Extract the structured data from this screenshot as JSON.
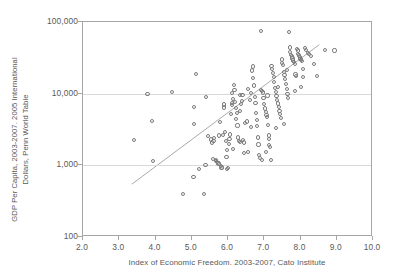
{
  "chart_data": {
    "type": "scatter",
    "title": "",
    "xlabel": "Index of Economic Freedom. 2003-2007, Cato Institute",
    "ylabel_line1": "GDP Per Capita, 2003-2007. 2005 International",
    "ylabel_line2": "Dollars, Penn World Table",
    "xlim": [
      2.0,
      10.0
    ],
    "ylim": [
      100,
      100000
    ],
    "yscale": "log",
    "xscale": "linear",
    "xticks": [
      "2.0",
      "3.0",
      "4.0",
      "5.0",
      "6.0",
      "7.0",
      "8.0",
      "9.0",
      "10.0"
    ],
    "xtick_values": [
      2.0,
      3.0,
      4.0,
      5.0,
      6.0,
      7.0,
      8.0,
      9.0,
      10.0
    ],
    "yticks": [
      "100",
      "1,000",
      "10,000",
      "100,000"
    ],
    "ytick_values": [
      100,
      1000,
      10000,
      100000
    ],
    "grid": "horizontal",
    "gridlines_at": [
      1000,
      10000
    ],
    "legend": "none",
    "marker_style": "open-circle",
    "marker_color": "#7b7b7b",
    "gridline_color": "#d9d9d9",
    "frame_color": "#a6a6a6",
    "text_color": "#595959",
    "trendline": {
      "label": "linear fit (log scale)",
      "color": "#9e9e9e",
      "x_start": 3.35,
      "y_start": 520,
      "x_end": 8.57,
      "y_end": 48000
    },
    "series": [
      {
        "name": "Countries",
        "points": [
          [
            3.4,
            2250
          ],
          [
            3.78,
            9800
          ],
          [
            3.9,
            4150
          ],
          [
            3.92,
            1150
          ],
          [
            4.46,
            10600
          ],
          [
            4.75,
            400
          ],
          [
            5.05,
            680
          ],
          [
            5.06,
            3820
          ],
          [
            5.07,
            6450
          ],
          [
            5.11,
            18700
          ],
          [
            5.2,
            900
          ],
          [
            5.34,
            400
          ],
          [
            5.38,
            1000
          ],
          [
            5.4,
            9100
          ],
          [
            5.44,
            2550
          ],
          [
            5.52,
            2300
          ],
          [
            5.56,
            2080
          ],
          [
            5.58,
            1230
          ],
          [
            5.6,
            2180
          ],
          [
            5.62,
            2420
          ],
          [
            5.66,
            1180
          ],
          [
            5.68,
            1150
          ],
          [
            5.7,
            1120
          ],
          [
            5.72,
            1090
          ],
          [
            5.74,
            1060
          ],
          [
            5.76,
            2600
          ],
          [
            5.78,
            4050
          ],
          [
            5.8,
            980
          ],
          [
            5.82,
            930
          ],
          [
            5.84,
            920
          ],
          [
            5.86,
            2620
          ],
          [
            5.88,
            6400
          ],
          [
            5.9,
            7050
          ],
          [
            5.92,
            2950
          ],
          [
            5.94,
            2200
          ],
          [
            5.96,
            1300
          ],
          [
            5.98,
            900
          ],
          [
            6.0,
            910
          ],
          [
            6.02,
            2000
          ],
          [
            6.04,
            2350
          ],
          [
            6.06,
            2700
          ],
          [
            6.08,
            5200
          ],
          [
            6.1,
            6900
          ],
          [
            6.12,
            7400
          ],
          [
            6.14,
            8400
          ],
          [
            6.16,
            13200
          ],
          [
            6.18,
            11300
          ],
          [
            6.2,
            7600
          ],
          [
            6.22,
            6300
          ],
          [
            6.24,
            5400
          ],
          [
            6.26,
            3600
          ],
          [
            6.28,
            2450
          ],
          [
            6.3,
            2180
          ],
          [
            6.32,
            2100
          ],
          [
            6.34,
            5700
          ],
          [
            6.36,
            7200
          ],
          [
            6.38,
            7800
          ],
          [
            6.4,
            9500
          ],
          [
            6.42,
            2250
          ],
          [
            6.44,
            2080
          ],
          [
            6.48,
            3900
          ],
          [
            6.52,
            4100
          ],
          [
            6.56,
            1550
          ],
          [
            6.6,
            8100
          ],
          [
            6.64,
            10200
          ],
          [
            6.66,
            21000
          ],
          [
            6.68,
            24000
          ],
          [
            6.7,
            16500
          ],
          [
            6.72,
            13000
          ],
          [
            6.74,
            9000
          ],
          [
            6.76,
            7500
          ],
          [
            6.78,
            5400
          ],
          [
            6.8,
            4300
          ],
          [
            6.82,
            2450
          ],
          [
            6.84,
            1950
          ],
          [
            6.86,
            1400
          ],
          [
            6.88,
            1250
          ],
          [
            6.9,
            74000
          ],
          [
            6.92,
            11200
          ],
          [
            6.94,
            10800
          ],
          [
            6.96,
            10400
          ],
          [
            6.98,
            8600
          ],
          [
            7.0,
            7100
          ],
          [
            7.02,
            6200
          ],
          [
            7.04,
            5600
          ],
          [
            7.06,
            5100
          ],
          [
            7.08,
            4700
          ],
          [
            7.1,
            3700
          ],
          [
            7.12,
            2600
          ],
          [
            7.14,
            2350
          ],
          [
            7.16,
            1800
          ],
          [
            7.18,
            1200
          ],
          [
            7.2,
            24500
          ],
          [
            7.22,
            22000
          ],
          [
            7.24,
            19500
          ],
          [
            7.26,
            17000
          ],
          [
            7.28,
            14500
          ],
          [
            7.3,
            12000
          ],
          [
            7.32,
            10500
          ],
          [
            7.34,
            9200
          ],
          [
            7.36,
            8200
          ],
          [
            7.38,
            7300
          ],
          [
            7.4,
            6500
          ],
          [
            7.42,
            5800
          ],
          [
            7.44,
            5200
          ],
          [
            7.46,
            4600
          ],
          [
            7.48,
            30000
          ],
          [
            7.5,
            27000
          ],
          [
            7.52,
            25000
          ],
          [
            7.54,
            20000
          ],
          [
            7.56,
            18000
          ],
          [
            7.58,
            16000
          ],
          [
            7.6,
            13500
          ],
          [
            7.62,
            11500
          ],
          [
            7.64,
            9800
          ],
          [
            7.66,
            8700
          ],
          [
            7.68,
            73000
          ],
          [
            7.7,
            44000
          ],
          [
            7.72,
            38000
          ],
          [
            7.74,
            35000
          ],
          [
            7.76,
            33000
          ],
          [
            7.78,
            31000
          ],
          [
            7.8,
            29000
          ],
          [
            7.82,
            27500
          ],
          [
            7.84,
            26000
          ],
          [
            7.86,
            18500
          ],
          [
            7.88,
            17500
          ],
          [
            7.9,
            42000
          ],
          [
            7.92,
            40000
          ],
          [
            7.94,
            36000
          ],
          [
            7.96,
            34000
          ],
          [
            7.98,
            32000
          ],
          [
            8.0,
            30500
          ],
          [
            8.02,
            29500
          ],
          [
            8.04,
            28500
          ],
          [
            8.06,
            22000
          ],
          [
            8.08,
            17000
          ],
          [
            8.12,
            43000
          ],
          [
            8.16,
            41000
          ],
          [
            8.2,
            37000
          ],
          [
            8.24,
            35500
          ],
          [
            8.3,
            33500
          ],
          [
            8.38,
            26000
          ],
          [
            8.45,
            17500
          ],
          [
            8.68,
            40500
          ],
          [
            8.94,
            40000
          ],
          [
            6.94,
            1200
          ],
          [
            7.05,
            1550
          ],
          [
            7.12,
            1900
          ],
          [
            6.45,
            1500
          ],
          [
            6.14,
            1700
          ],
          [
            5.97,
            1620
          ],
          [
            6.63,
            3400
          ],
          [
            7.33,
            3300
          ],
          [
            7.55,
            3800
          ],
          [
            6.21,
            4450
          ],
          [
            6.79,
            3500
          ],
          [
            7.09,
            9400
          ],
          [
            7.37,
            12500
          ],
          [
            7.63,
            21500
          ],
          [
            6.55,
            11500
          ],
          [
            6.33,
            9700
          ],
          [
            6.11,
            10100
          ],
          [
            7.85,
            11000
          ],
          [
            8.02,
            12500
          ]
        ]
      }
    ]
  }
}
